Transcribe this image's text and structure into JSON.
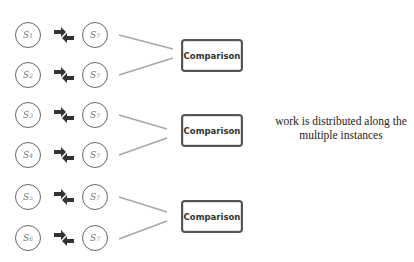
{
  "diagram": {
    "pairs": [
      {
        "left": {
          "base": "S",
          "sub": "1"
        },
        "right": {
          "base": "S",
          "sub": "7"
        },
        "arrow_icon": "exchange-arrows-icon"
      },
      {
        "left": {
          "base": "S",
          "sub": "2"
        },
        "right": {
          "base": "S",
          "sub": "7"
        },
        "arrow_icon": "exchange-arrows-icon"
      },
      {
        "left": {
          "base": "S",
          "sub": "3"
        },
        "right": {
          "base": "S",
          "sub": "7"
        },
        "arrow_icon": "exchange-arrows-icon"
      },
      {
        "left": {
          "base": "S",
          "sub": "4"
        },
        "right": {
          "base": "S",
          "sub": "7"
        },
        "arrow_icon": "exchange-arrows-icon"
      },
      {
        "left": {
          "base": "S",
          "sub": "5"
        },
        "right": {
          "base": "S",
          "sub": "7"
        },
        "arrow_icon": "exchange-arrows-icon"
      },
      {
        "left": {
          "base": "S",
          "sub": "6"
        },
        "right": {
          "base": "S",
          "sub": "7"
        },
        "arrow_icon": "exchange-arrows-icon"
      }
    ],
    "comparison_boxes": [
      {
        "label": "Comparison"
      },
      {
        "label": "Comparison"
      },
      {
        "label": "Comparison"
      }
    ],
    "note": {
      "line1": "work is distributed along the",
      "line2": "multiple instances"
    },
    "colors": {
      "circle_border": "#666666",
      "box_border": "#555555",
      "connector": "#a8a8a8",
      "arrow": "#333333"
    }
  }
}
